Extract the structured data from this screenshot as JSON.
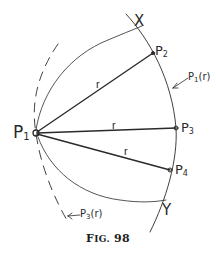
{
  "figure": {
    "caption_prefix": "F",
    "caption_smallcaps": "IG.",
    "caption_number": "98",
    "stroke_color": "#2a2a2a"
  },
  "points": {
    "p1": {
      "base": "P",
      "sub": "1"
    },
    "p2": {
      "base": "P",
      "sub": "2"
    },
    "p3": {
      "base": "P",
      "sub": "3"
    },
    "p4": {
      "base": "P",
      "sub": "4"
    }
  },
  "radii": {
    "r_p2": "r",
    "r_p3": "r",
    "r_p4": "r"
  },
  "intersections": {
    "x": "X",
    "y": "Y"
  },
  "curves": {
    "p1_r": {
      "base": "P",
      "sub": "1",
      "arg": "(r)"
    },
    "p3_r": {
      "base": "P",
      "sub": "3",
      "arg": "(r)"
    }
  }
}
